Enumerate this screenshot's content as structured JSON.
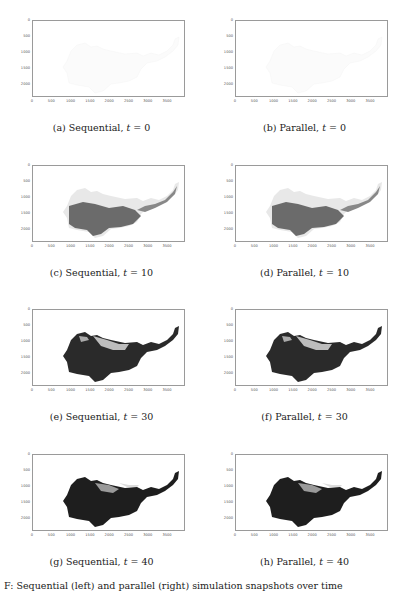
{
  "figure": {
    "type": "image-grid",
    "columns": [
      "Sequential",
      "Parallel"
    ],
    "axes": {
      "xticks": [
        "0",
        "500",
        "1000",
        "1500",
        "2000",
        "2500",
        "3000",
        "3500"
      ],
      "yticks": [
        "0",
        "500",
        "1000",
        "1500",
        "2000"
      ]
    },
    "panels": [
      {
        "label": "(a) Sequential, ",
        "var": "t",
        "eq": " = 0",
        "t": 0,
        "method": "Sequential",
        "fill": "none"
      },
      {
        "label": "(b) Parallel, ",
        "var": "t",
        "eq": " = 0",
        "t": 0,
        "method": "Parallel",
        "fill": "none"
      },
      {
        "label": "(c) Sequential, ",
        "var": "t",
        "eq": " = 10",
        "t": 10,
        "method": "Sequential",
        "fill": "partial"
      },
      {
        "label": "(d) Parallel, ",
        "var": "t",
        "eq": " = 10",
        "t": 10,
        "method": "Parallel",
        "fill": "partial"
      },
      {
        "label": "(e) Sequential, ",
        "var": "t",
        "eq": " = 30",
        "t": 30,
        "method": "Sequential",
        "fill": "dense"
      },
      {
        "label": "(f) Parallel, ",
        "var": "t",
        "eq": " = 30",
        "t": 30,
        "method": "Parallel",
        "fill": "dense"
      },
      {
        "label": "(g) Sequential, ",
        "var": "t",
        "eq": " = 40",
        "t": 40,
        "method": "Sequential",
        "fill": "full"
      },
      {
        "label": "(h) Parallel, ",
        "var": "t",
        "eq": " = 40",
        "t": 40,
        "method": "Parallel",
        "fill": "full"
      }
    ],
    "caption_partial": "F: Sequential (left) and parallel (right) simulation snapshots over time"
  }
}
